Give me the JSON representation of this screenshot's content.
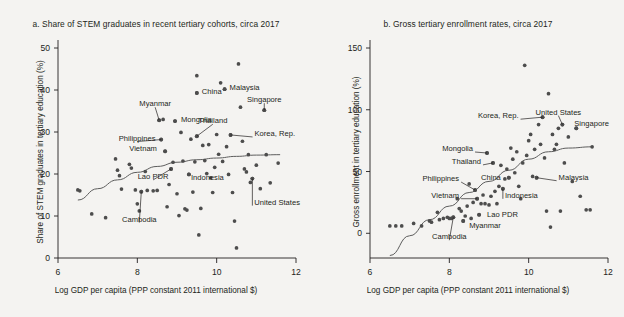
{
  "figure": {
    "background_color": "#f4f3f1",
    "ink_color": "#231f20",
    "dot_color": "#4d4d4d"
  },
  "panel_a": {
    "title": "a. Share of STEM graduates in recent tertiary cohorts, circa 2017",
    "ylabel": "Share of STEM graduates in tertiary education (%)",
    "xlabel": "Log GDP per capita (PPP constant 2011 international $)",
    "yticks": [
      "0",
      "10",
      "20",
      "30",
      "40",
      "50"
    ],
    "xticks": [
      "6",
      "8",
      "10",
      "12"
    ]
  },
  "panel_b": {
    "title": "b. Gross tertiary enrollment rates, circa 2017",
    "ylabel": "Gross enrollment in tertiary education (%)",
    "xlabel": "Log GDP per capita (PPP constant 2011 international $)",
    "yticks": [
      "0",
      "50",
      "100",
      "150"
    ],
    "xticks": [
      "6",
      "8",
      "10",
      "12"
    ]
  },
  "chart_data": [
    {
      "type": "scatter",
      "panel": "a",
      "title": "a. Share of STEM graduates in recent tertiary cohorts, circa 2017",
      "xlabel": "Log GDP per capita (PPP constant 2011 international $)",
      "ylabel": "Share of STEM graduates in tertiary education (%)",
      "xlim": [
        6,
        12
      ],
      "ylim": [
        0,
        50
      ],
      "xticks": [
        6,
        8,
        10,
        12
      ],
      "yticks": [
        0,
        10,
        20,
        30,
        40,
        50
      ],
      "grid": false,
      "legend": "none",
      "fit_curve": {
        "name": "lowess-fit",
        "points": [
          [
            6.5,
            13.8
          ],
          [
            7.0,
            16.5
          ],
          [
            7.5,
            18.6
          ],
          [
            8.0,
            20.4
          ],
          [
            8.5,
            21.8
          ],
          [
            9.0,
            22.8
          ],
          [
            9.5,
            23.4
          ],
          [
            10.0,
            23.8
          ],
          [
            10.5,
            24.2
          ],
          [
            11.0,
            24.5
          ],
          [
            11.6,
            24.6
          ]
        ]
      },
      "labeled_points": [
        {
          "label": "Malaysia",
          "x": 10.2,
          "y": 40.2
        },
        {
          "label": "China",
          "x": 9.5,
          "y": 39.3
        },
        {
          "label": "Singapore",
          "x": 11.2,
          "y": 35.2
        },
        {
          "label": "Myanmar",
          "x": 8.55,
          "y": 32.8
        },
        {
          "label": "Philippines",
          "x": 8.6,
          "y": 28.2
        },
        {
          "label": "Mongolia",
          "x": 8.95,
          "y": 32.6
        },
        {
          "label": "Thailand",
          "x": 9.5,
          "y": 29.0
        },
        {
          "label": "Korea, Rep.",
          "x": 10.35,
          "y": 29.3
        },
        {
          "label": "Vietnam",
          "x": 8.7,
          "y": 25.4
        },
        {
          "label": "Lao PDR",
          "x": 8.85,
          "y": 21.2
        },
        {
          "label": "Indonesia",
          "x": 9.3,
          "y": 19.9
        },
        {
          "label": "Cambodia",
          "x": 8.1,
          "y": 15.8
        },
        {
          "label": "United States",
          "x": 10.9,
          "y": 18.9
        }
      ],
      "points": [
        [
          6.5,
          16.2
        ],
        [
          6.55,
          16.0
        ],
        [
          6.85,
          10.5
        ],
        [
          7.2,
          9.6
        ],
        [
          7.45,
          23.6
        ],
        [
          7.5,
          20.9
        ],
        [
          7.55,
          19.6
        ],
        [
          7.6,
          16.4
        ],
        [
          7.8,
          22.3
        ],
        [
          7.85,
          21.4
        ],
        [
          7.95,
          16.2
        ],
        [
          8.0,
          12.9
        ],
        [
          8.05,
          11.2
        ],
        [
          8.1,
          15.8
        ],
        [
          8.2,
          20.6
        ],
        [
          8.25,
          16.1
        ],
        [
          8.4,
          16.0
        ],
        [
          8.5,
          16.1
        ],
        [
          8.55,
          32.8
        ],
        [
          8.6,
          28.2
        ],
        [
          8.65,
          33.0
        ],
        [
          8.7,
          25.4
        ],
        [
          8.75,
          12.2
        ],
        [
          8.8,
          17.5
        ],
        [
          8.85,
          21.2
        ],
        [
          8.9,
          22.8
        ],
        [
          8.95,
          32.6
        ],
        [
          9.0,
          15.3
        ],
        [
          9.05,
          10.1
        ],
        [
          9.1,
          29.9
        ],
        [
          9.15,
          23.1
        ],
        [
          9.2,
          11.7
        ],
        [
          9.25,
          11.4
        ],
        [
          9.3,
          19.9
        ],
        [
          9.35,
          28.3
        ],
        [
          9.4,
          15.7
        ],
        [
          9.45,
          22.9
        ],
        [
          9.5,
          43.4
        ],
        [
          9.5,
          39.3
        ],
        [
          9.5,
          29.0
        ],
        [
          9.55,
          5.5
        ],
        [
          9.6,
          11.8
        ],
        [
          9.65,
          26.8
        ],
        [
          9.7,
          23.2
        ],
        [
          9.75,
          20.1
        ],
        [
          9.8,
          27.0
        ],
        [
          9.85,
          19.1
        ],
        [
          9.9,
          15.6
        ],
        [
          9.95,
          21.6
        ],
        [
          10.0,
          29.4
        ],
        [
          10.05,
          24.7
        ],
        [
          10.1,
          41.7
        ],
        [
          10.15,
          23.0
        ],
        [
          10.2,
          40.2
        ],
        [
          10.25,
          26.5
        ],
        [
          10.3,
          19.9
        ],
        [
          10.35,
          29.3
        ],
        [
          10.4,
          15.6
        ],
        [
          10.45,
          8.8
        ],
        [
          10.5,
          2.4
        ],
        [
          10.55,
          46.2
        ],
        [
          10.6,
          35.9
        ],
        [
          10.65,
          27.8
        ],
        [
          10.7,
          21.2
        ],
        [
          10.75,
          20.5
        ],
        [
          10.8,
          24.6
        ],
        [
          10.85,
          18.0
        ],
        [
          10.9,
          18.9
        ],
        [
          11.0,
          22.1
        ],
        [
          11.1,
          16.5
        ],
        [
          11.2,
          35.2
        ],
        [
          11.25,
          24.6
        ],
        [
          11.35,
          17.9
        ],
        [
          11.55,
          22.6
        ]
      ]
    },
    {
      "type": "scatter",
      "panel": "b",
      "title": "b. Gross tertiary enrollment rates, circa 2017",
      "xlabel": "Log GDP per capita (PPP constant 2011 international $)",
      "ylabel": "Gross enrollment in tertiary education (%)",
      "xlim": [
        6,
        12
      ],
      "ylim": [
        -20,
        150
      ],
      "xticks": [
        6,
        8,
        10,
        12
      ],
      "yticks": [
        0,
        50,
        100,
        150
      ],
      "grid": false,
      "legend": "none",
      "fit_curve": {
        "name": "lowess-fit",
        "points": [
          [
            6.5,
            -18
          ],
          [
            7.0,
            -2
          ],
          [
            7.5,
            11
          ],
          [
            8.0,
            22
          ],
          [
            8.5,
            33
          ],
          [
            9.0,
            42
          ],
          [
            9.5,
            51
          ],
          [
            10.0,
            60
          ],
          [
            10.5,
            66
          ],
          [
            11.0,
            69
          ],
          [
            11.6,
            70
          ]
        ]
      },
      "labeled_points": [
        {
          "label": "Korea, Rep.",
          "x": 10.35,
          "y": 94
        },
        {
          "label": "United States",
          "x": 10.85,
          "y": 88
        },
        {
          "label": "Singapore",
          "x": 11.2,
          "y": 85
        },
        {
          "label": "Mongolia",
          "x": 8.95,
          "y": 65
        },
        {
          "label": "Thailand",
          "x": 9.1,
          "y": 57
        },
        {
          "label": "Philippines",
          "x": 8.65,
          "y": 35
        },
        {
          "label": "Vietnam",
          "x": 8.7,
          "y": 28
        },
        {
          "label": "China",
          "x": 9.5,
          "y": 45
        },
        {
          "label": "Indonesia",
          "x": 9.35,
          "y": 36
        },
        {
          "label": "Malaysia",
          "x": 10.2,
          "y": 45
        },
        {
          "label": "Lao PDR",
          "x": 8.75,
          "y": 15
        },
        {
          "label": "Myanmar",
          "x": 8.35,
          "y": 10
        },
        {
          "label": "Cambodia",
          "x": 8.1,
          "y": 13
        }
      ],
      "points": [
        [
          6.5,
          6
        ],
        [
          6.65,
          6
        ],
        [
          6.8,
          6
        ],
        [
          7.1,
          8
        ],
        [
          7.3,
          6
        ],
        [
          7.5,
          10
        ],
        [
          7.55,
          9
        ],
        [
          7.7,
          17
        ],
        [
          7.75,
          11
        ],
        [
          7.85,
          12
        ],
        [
          7.95,
          13
        ],
        [
          8.0,
          12
        ],
        [
          8.05,
          12
        ],
        [
          8.1,
          13
        ],
        [
          8.2,
          28
        ],
        [
          8.25,
          20
        ],
        [
          8.3,
          18
        ],
        [
          8.35,
          10
        ],
        [
          8.4,
          14
        ],
        [
          8.45,
          22
        ],
        [
          8.5,
          40
        ],
        [
          8.55,
          12
        ],
        [
          8.6,
          25
        ],
        [
          8.65,
          35
        ],
        [
          8.7,
          28
        ],
        [
          8.75,
          15
        ],
        [
          8.8,
          24
        ],
        [
          8.85,
          31
        ],
        [
          8.9,
          24
        ],
        [
          8.95,
          65
        ],
        [
          9.0,
          23
        ],
        [
          9.05,
          30
        ],
        [
          9.1,
          57
        ],
        [
          9.15,
          34
        ],
        [
          9.2,
          24
        ],
        [
          9.25,
          38
        ],
        [
          9.3,
          55
        ],
        [
          9.35,
          36
        ],
        [
          9.4,
          44
        ],
        [
          9.45,
          52
        ],
        [
          9.5,
          45
        ],
        [
          9.55,
          69
        ],
        [
          9.6,
          60
        ],
        [
          9.65,
          49
        ],
        [
          9.7,
          66
        ],
        [
          9.75,
          38
        ],
        [
          9.8,
          28
        ],
        [
          9.85,
          57
        ],
        [
          9.9,
          136
        ],
        [
          9.95,
          63
        ],
        [
          10.0,
          75
        ],
        [
          10.05,
          80
        ],
        [
          10.1,
          46
        ],
        [
          10.15,
          68
        ],
        [
          10.2,
          45
        ],
        [
          10.25,
          88
        ],
        [
          10.3,
          72
        ],
        [
          10.35,
          94
        ],
        [
          10.4,
          61
        ],
        [
          10.45,
          18
        ],
        [
          10.5,
          113
        ],
        [
          10.55,
          5
        ],
        [
          10.6,
          80
        ],
        [
          10.65,
          68
        ],
        [
          10.7,
          72
        ],
        [
          10.75,
          85
        ],
        [
          10.8,
          18
        ],
        [
          10.85,
          88
        ],
        [
          10.9,
          57
        ],
        [
          11.0,
          78
        ],
        [
          11.1,
          42
        ],
        [
          11.2,
          85
        ],
        [
          11.3,
          30
        ],
        [
          11.45,
          19
        ],
        [
          11.55,
          19
        ],
        [
          11.6,
          70
        ]
      ]
    }
  ]
}
